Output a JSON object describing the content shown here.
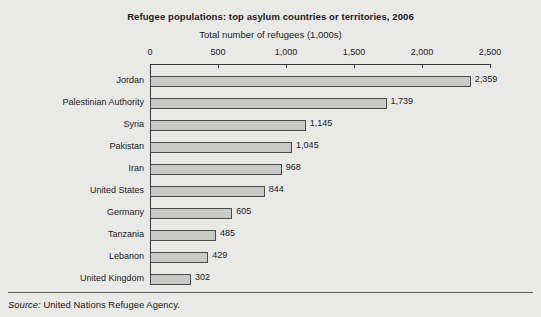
{
  "chart_data": {
    "type": "bar",
    "orientation": "horizontal",
    "title": "Refugee populations: top asylum countries or territories, 2006",
    "subtitle": "Total number of refugees (1,000s)",
    "xlabel": "Total number of refugees (1,000s)",
    "ylabel": "",
    "xlim": [
      0,
      2500
    ],
    "xticks": [
      0,
      500,
      1000,
      1500,
      2000,
      2500
    ],
    "xtick_labels": [
      "0",
      "500",
      "1,000",
      "1,500",
      "2,000",
      "2,500"
    ],
    "grid": false,
    "legend": false,
    "categories": [
      "Jordan",
      "Palestinian Authority",
      "Syria",
      "Pakistan",
      "Iran",
      "United States",
      "Germany",
      "Tanzania",
      "Lebanon",
      "United Kingdom"
    ],
    "values": [
      2359,
      1739,
      1145,
      1045,
      968,
      844,
      605,
      485,
      429,
      302
    ],
    "value_labels": [
      "2,359",
      "1,739",
      "1,145",
      "1,045",
      "968",
      "844",
      "605",
      "485",
      "429",
      "302"
    ],
    "bar_fill_color": "#c9c9c7",
    "bar_border_color": "#4a4a4a",
    "background_color": "#e9e9e7"
  },
  "footer": {
    "source_label": "Source:",
    "source_text": "United Nations Refugee Agency."
  }
}
